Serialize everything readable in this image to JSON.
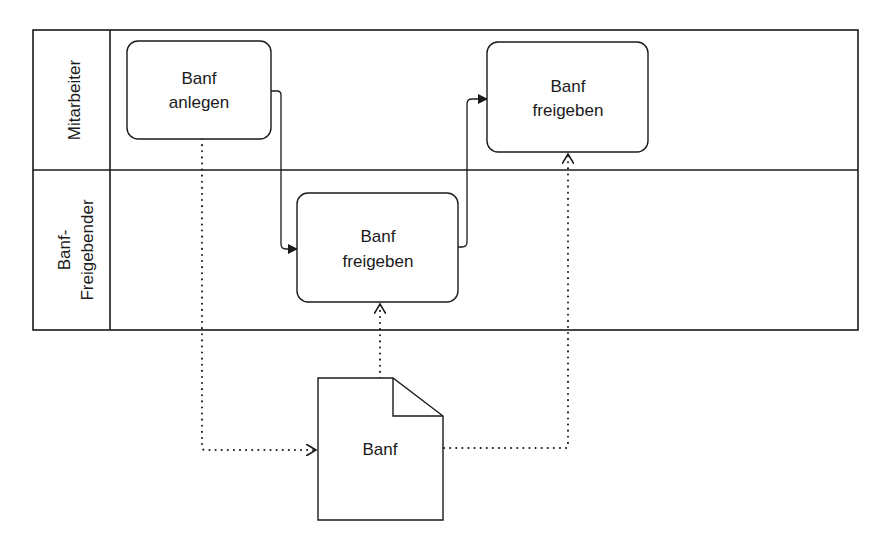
{
  "diagram": {
    "type": "BPMN swimlane",
    "lanes": [
      {
        "id": "lane-mitarbeiter",
        "label_lines": [
          "Mitarbeiter"
        ]
      },
      {
        "id": "lane-freigebender",
        "label_lines": [
          "Banf-",
          "Freigebender"
        ]
      }
    ],
    "tasks": [
      {
        "id": "task-banf-anlegen",
        "lane": "Mitarbeiter",
        "label_lines": [
          "Banf",
          "anlegen"
        ]
      },
      {
        "id": "task-banf-freigeben-top",
        "lane": "Mitarbeiter",
        "label_lines": [
          "Banf",
          "freigeben"
        ]
      },
      {
        "id": "task-banf-freigeben-lower",
        "lane": "Banf-Freigebender",
        "label_lines": [
          "Banf",
          "freigeben"
        ]
      }
    ],
    "data_objects": [
      {
        "id": "doc-banf",
        "label": "Banf"
      }
    ],
    "sequence_flows": [
      {
        "from": "Banf anlegen",
        "to": "Banf freigeben (Banf-Freigebender)"
      },
      {
        "from": "Banf freigeben (Banf-Freigebender)",
        "to": "Banf freigeben (Mitarbeiter)"
      }
    ],
    "associations": [
      {
        "from": "Banf anlegen",
        "to": "Banf (document)"
      },
      {
        "from": "Banf (document)",
        "to": "Banf freigeben (Banf-Freigebender)"
      },
      {
        "from": "Banf (document)",
        "to": "Banf freigeben (Mitarbeiter)"
      }
    ],
    "colors": {
      "stroke": "#1a1a1a",
      "background": "#ffffff"
    }
  }
}
